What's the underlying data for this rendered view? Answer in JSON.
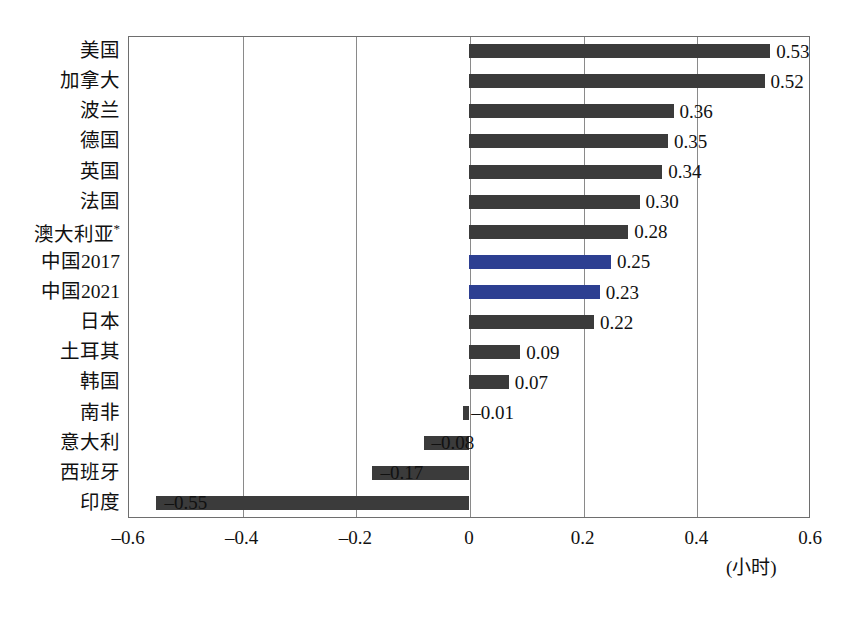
{
  "chart_data": {
    "type": "bar",
    "orientation": "horizontal",
    "title": "",
    "xlabel": "(小时)",
    "ylabel": "",
    "xlim": [
      -0.6,
      0.6
    ],
    "xticks": [
      "-0.6",
      "-0.4",
      "-0.2",
      "0",
      "0.2",
      "0.4",
      "0.6"
    ],
    "xtick_values": [
      -0.6,
      -0.4,
      -0.2,
      0,
      0.2,
      0.4,
      0.6
    ],
    "grid": true,
    "legend": "none",
    "categories": [
      "美国",
      "加拿大",
      "波兰",
      "德国",
      "英国",
      "法国",
      "澳大利亚*",
      "中国2017",
      "中国2021",
      "日本",
      "土耳其",
      "韩国",
      "南非",
      "意大利",
      "西班牙",
      "印度"
    ],
    "values": [
      0.53,
      0.52,
      0.36,
      0.35,
      0.34,
      0.3,
      0.28,
      0.25,
      0.23,
      0.22,
      0.09,
      0.07,
      -0.01,
      -0.08,
      -0.17,
      -0.55
    ],
    "value_labels": [
      "0.53",
      "0.52",
      "0.36",
      "0.35",
      "0.34",
      "0.30",
      "0.28",
      "0.25",
      "0.23",
      "0.22",
      "0.09",
      "0.07",
      "–0.01",
      "–0.08",
      "–0.17",
      "–0.55"
    ],
    "highlight_indices": [
      7,
      8
    ],
    "colors": {
      "bar_default": "#3b3b3b",
      "bar_highlight": "#2d3f91",
      "gridline": "#8a8a8a",
      "axis": "#6e6e6e",
      "text": "#111111"
    }
  },
  "caption": ""
}
